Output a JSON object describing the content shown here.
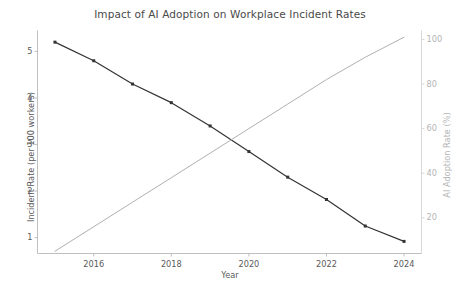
{
  "chart_data": {
    "type": "line",
    "title": "Impact of AI Adoption on Workplace Incident Rates",
    "xlabel": "Year",
    "ylabel": "Incident Rate (per 100 workers)",
    "ylabel_secondary": "AI Adoption Rate (%)",
    "x": [
      2015,
      2016,
      2017,
      2018,
      2019,
      2020,
      2021,
      2022,
      2023,
      2024
    ],
    "xlim": [
      2014.55,
      2024.45
    ],
    "xticks": [
      2016,
      2018,
      2020,
      2022,
      2024
    ],
    "xticklabels": [
      "2016",
      "2018",
      "2020",
      "2022",
      "2024"
    ],
    "ylim": [
      0.66,
      5.45
    ],
    "yticks": [
      1,
      2,
      3,
      4,
      5
    ],
    "yticklabels": [
      "1",
      "2",
      "3",
      "4",
      "5"
    ],
    "ylim_secondary": [
      4.0,
      104.0
    ],
    "yticks_secondary": [
      20,
      40,
      60,
      80,
      100
    ],
    "yticklabels_secondary": [
      "20",
      "40",
      "60",
      "80",
      "100"
    ],
    "grid": false,
    "legend": "none",
    "series": [
      {
        "name": "Incident Rate (per 100 workers)",
        "axis": "left",
        "color": "#333333",
        "marker": "square",
        "marker_size": 3,
        "linewidth": 1.2,
        "values": [
          5.2,
          4.8,
          4.3,
          3.9,
          3.4,
          2.85,
          2.3,
          1.82,
          1.25,
          0.92
        ]
      },
      {
        "name": "AI Adoption Rate (%)",
        "axis": "right",
        "color": "#b0b0b0",
        "marker": "none",
        "linewidth": 1.0,
        "values": [
          5,
          16,
          27,
          38,
          49,
          60,
          71,
          82,
          92,
          101
        ]
      }
    ]
  }
}
